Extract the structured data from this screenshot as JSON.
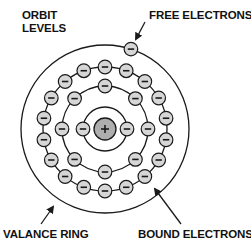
{
  "labels": {
    "orbit_levels_line1": "ORBIT",
    "orbit_levels_line2": "LEVELS",
    "free_electrons": "FREE ELECTRONS",
    "valance_ring": "VALANCE RING",
    "bound_electrons": "BOUND ELECTRONS"
  },
  "atom": {
    "nucleus_symbol": "+",
    "electron_symbol": "−",
    "center": [
      105,
      129
    ],
    "nucleus_radius": 11,
    "electron_radius": 6.8,
    "rings": [
      {
        "name": "ring-1",
        "radius": 22,
        "electrons": 2
      },
      {
        "name": "ring-2",
        "radius": 43,
        "electrons": 8
      },
      {
        "name": "ring-3",
        "radius": 62,
        "electrons": 18
      },
      {
        "name": "valance-ring",
        "radius": 84,
        "electrons": 1
      }
    ]
  },
  "colors": {
    "line": "#1a1a1a",
    "electron_fill": "#d6d6d6",
    "nucleus_fill": "#aeaeae",
    "background": "#ffffff"
  }
}
